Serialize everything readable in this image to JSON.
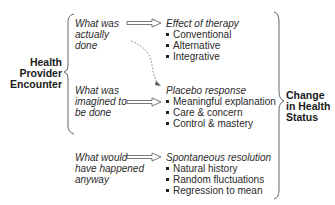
{
  "diagram": {
    "left_label": [
      "Health",
      "Provider",
      "Encounter"
    ],
    "right_label": [
      "Change",
      "in Health",
      "Status"
    ],
    "sources": [
      {
        "lines": [
          "What was",
          "actually",
          "done"
        ]
      },
      {
        "lines": [
          "What was",
          "imagined to",
          "be done"
        ]
      },
      {
        "lines": [
          "What would",
          "have happened",
          "anyway"
        ]
      }
    ],
    "outcomes": [
      {
        "title": "Effect of therapy",
        "items": [
          "Conventional",
          "Alternative",
          "Integrative"
        ]
      },
      {
        "title": "Placebo response",
        "items": [
          "Meaningful explanation",
          "Care & concern",
          "Control & mastery"
        ]
      },
      {
        "title": "Spontaneous resolution",
        "items": [
          "Natural history",
          "Random fluctuations",
          "Regression to mean"
        ]
      }
    ],
    "connectors": {
      "arrow_style": "double-line hollow arrow",
      "dashed_arrow": "from 'What was actually done' to 'Placebo response'",
      "line_color": "#555555"
    }
  }
}
